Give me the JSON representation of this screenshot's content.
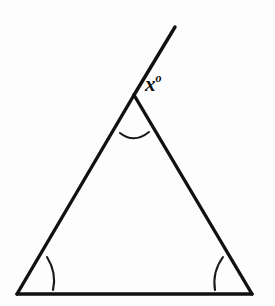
{
  "figure": {
    "kind": "geometry-diagram",
    "background_color": "#fdfdfd",
    "stroke_color": "#111111",
    "width": 275,
    "height": 306
  },
  "labels": {
    "exterior_angle": {
      "variable": "x",
      "degree_symbol": "o",
      "full_text": "x°",
      "x": 145,
      "y": 74
    }
  },
  "chart_data": {
    "type": "diagram",
    "title": "",
    "shape": "triangle-with-extended-side",
    "vertices": [
      {
        "name": "apex",
        "x": 134,
        "y": 95
      },
      {
        "name": "bottom-left",
        "x": 17,
        "y": 294
      },
      {
        "name": "bottom-right",
        "x": 252,
        "y": 294
      }
    ],
    "segments": [
      {
        "name": "left-side",
        "from": "bottom-left",
        "to": "apex",
        "x1": 17,
        "y1": 294,
        "x2": 134,
        "y2": 95
      },
      {
        "name": "right-side",
        "from": "apex",
        "to": "bottom-right",
        "x1": 134,
        "y1": 95,
        "x2": 252,
        "y2": 294
      },
      {
        "name": "base",
        "from": "bottom-left",
        "to": "bottom-right",
        "x1": 17,
        "y1": 294,
        "x2": 252,
        "y2": 294
      },
      {
        "name": "extended-ray",
        "from": "apex",
        "to": "ray-end",
        "x1": 134,
        "y1": 95,
        "x2": 175,
        "y2": 27
      }
    ],
    "angle_marks": [
      {
        "name": "apex-interior-arc",
        "at_vertex": "apex",
        "path": "M 120 133 Q 134 144 149 132"
      },
      {
        "name": "bottom-left-arc",
        "at_vertex": "bottom-left",
        "path": "M 47 257 Q 57 273 53 290"
      },
      {
        "name": "bottom-right-arc",
        "at_vertex": "bottom-right",
        "path": "M 223 257 Q 212 272 215 290"
      }
    ],
    "annotations": [
      {
        "text": "x°",
        "x": 145,
        "y": 74,
        "refers_to": "exterior angle between extended ray and right side at apex"
      }
    ]
  }
}
